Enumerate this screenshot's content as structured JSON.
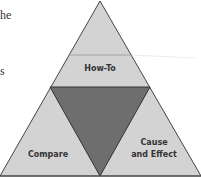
{
  "side_text": {
    "line1": "he",
    "line2": "s"
  },
  "diagram": {
    "sections": {
      "top": "How-To",
      "bottom_left": "Compare",
      "bottom_right_line1": "Cause",
      "bottom_right_line2": "and Effect"
    },
    "colors": {
      "outer_fill": "#d3d3d3",
      "center_fill": "#6e6e6e",
      "stroke": "#333333"
    }
  }
}
